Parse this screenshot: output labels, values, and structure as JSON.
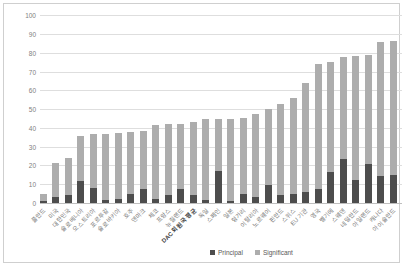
{
  "window": {
    "background_color": "#ffffff",
    "frame_border_color": "#cfcfcf"
  },
  "chart_data": {
    "type": "bar",
    "stacked": true,
    "orientation": "vertical",
    "title": "",
    "xlabel": "",
    "ylabel": "",
    "ylim": [
      0,
      100
    ],
    "y_ticks": [
      0,
      10,
      20,
      30,
      40,
      50,
      60,
      70,
      80,
      90,
      100
    ],
    "grid": "horizontal",
    "gridline_color": "#dedede",
    "tick_label_color": "#808080",
    "legend_position": "bottom",
    "categories": [
      "폴란드",
      "미국",
      "대한민국",
      "슬로베니아",
      "오스트리아",
      "포르투갈",
      "슬로바키아",
      "호주",
      "덴마크",
      "체코",
      "프랑스",
      "뉴질랜드",
      "DAC 회원국 평균",
      "독일",
      "스페인",
      "일본",
      "헝가리",
      "이탈리아",
      "노르웨이",
      "핀란드",
      "스위스",
      "EU 기관",
      "영국",
      "벨기에",
      "스웨덴",
      "네덜란드",
      "아일랜드",
      "캐나다",
      "아이슬란드"
    ],
    "bold_category": "DAC 회원국 평균",
    "series": [
      {
        "name": "Principal",
        "color": "#4d4d4d",
        "values": [
          1,
          3,
          4,
          11.5,
          8,
          1.5,
          2,
          5,
          7.5,
          2,
          4.5,
          7.5,
          4.5,
          1.5,
          17,
          1,
          5,
          3,
          9.5,
          4.5,
          5,
          6,
          7.5,
          16.5,
          23.5,
          12.5,
          21,
          14.5,
          15
        ]
      },
      {
        "name": "Significant",
        "color": "#adadad",
        "values": [
          4,
          18.5,
          20,
          24,
          29,
          35.5,
          35.5,
          33,
          31,
          39.5,
          37.5,
          34.5,
          38.5,
          43,
          28,
          44,
          40.5,
          44.5,
          40.5,
          48.5,
          51,
          58,
          66.5,
          58.5,
          54.5,
          66,
          58,
          71.5,
          71.5
        ]
      }
    ],
    "totals": [
      5,
      21.5,
      24,
      35.5,
      37,
      37,
      37.5,
      38,
      38.5,
      41.5,
      42,
      42,
      43,
      44.5,
      45,
      45,
      45.5,
      47.5,
      50,
      53,
      56,
      64,
      74,
      75,
      78,
      78.5,
      79,
      86,
      86.5
    ]
  },
  "legend": {
    "items": [
      {
        "label": "Principal",
        "color": "#4d4d4d"
      },
      {
        "label": "Significant",
        "color": "#adadad"
      }
    ]
  }
}
